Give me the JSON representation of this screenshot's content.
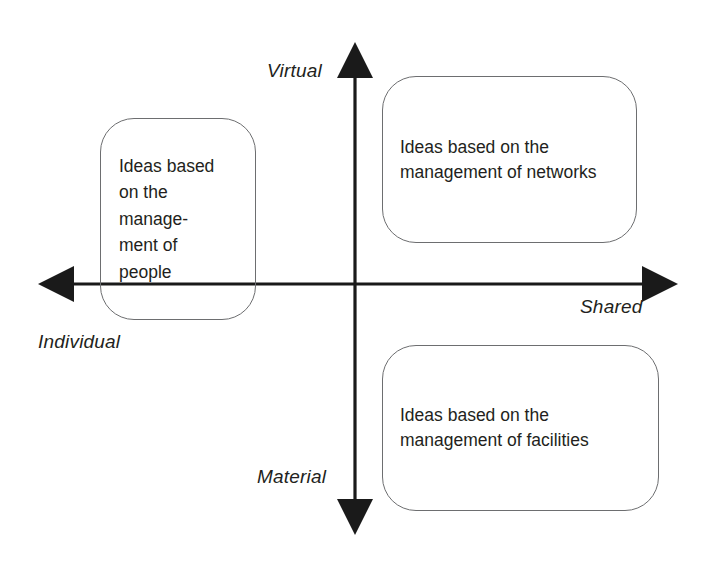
{
  "diagram": {
    "type": "2x2-quadrant-matrix",
    "axes": {
      "vertical": {
        "top_label": "Virtual",
        "bottom_label": "Material",
        "x": 355,
        "top_y": 42,
        "bottom_y": 535
      },
      "horizontal": {
        "left_label": "Individual",
        "right_label": "Shared",
        "y": 284,
        "left_x": 38,
        "right_x": 678
      },
      "origin": {
        "x": 355,
        "y": 284
      }
    },
    "labels": {
      "virtual": "Virtual",
      "individual": "Individual",
      "shared": "Shared",
      "material": "Material"
    },
    "boxes": [
      {
        "id": "left",
        "quadrant": "center-left",
        "text": "Ideas based\non the\nmanage-\nment of\npeople"
      },
      {
        "id": "topright",
        "quadrant": "upper-right",
        "text": "Ideas based on the\nmanagement of networks"
      },
      {
        "id": "bottomright",
        "quadrant": "lower-right",
        "text": "Ideas based on the\nmanagement of facilities"
      }
    ],
    "colors": {
      "background": "#ffffff",
      "axis": "#1a1a1a",
      "box_border": "#6d6e70",
      "text": "#231f20"
    }
  }
}
